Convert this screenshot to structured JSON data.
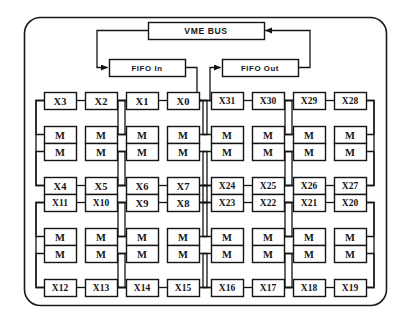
{
  "figure": {
    "frame": {
      "style": "rounded-rectangle",
      "stroke": "#1a1a1a"
    },
    "colors": {
      "background": "#ffffff",
      "box_fill": "#ffffff",
      "box_stroke": "#141414",
      "wire": "#141414",
      "text": "#141414"
    }
  },
  "bus": {
    "label": "VME BUS",
    "x": 148,
    "y": 22,
    "w": 116,
    "h": 17
  },
  "fifos": [
    {
      "name": "fifo-in",
      "label": "FIFO In",
      "x": 109,
      "y": 59,
      "w": 76,
      "h": 17
    },
    {
      "name": "fifo-out",
      "label": "FIFO Out",
      "x": 222,
      "y": 59,
      "w": 76,
      "h": 17
    }
  ],
  "arrows": [
    {
      "name": "bus-to-fifo-in",
      "from": "VME BUS",
      "to": "FIFO In",
      "direction": "left-down"
    },
    {
      "name": "fifo-out-to-bus",
      "from": "FIFO Out",
      "to": "VME BUS",
      "direction": "right-up"
    },
    {
      "name": "fifo-in-to-x0",
      "from": "FIFO In",
      "to": "X0",
      "direction": "down-left"
    },
    {
      "name": "x31-to-fifo-out",
      "from": "X31",
      "to": "FIFO Out",
      "direction": "up-right"
    }
  ],
  "grid": {
    "columns": 8,
    "rows": 4,
    "memory_label": "M",
    "col_x": [
      44,
      85,
      126,
      167,
      211,
      252,
      293,
      334
    ],
    "row_y": [
      92,
      143,
      194,
      245
    ],
    "box_w": 32,
    "box_h": 17,
    "row_gap": 17
  },
  "rows": [
    {
      "name": "row-1",
      "order": "x-top",
      "cells": [
        {
          "processor": "X3",
          "memory": "M"
        },
        {
          "processor": "X2",
          "memory": "M"
        },
        {
          "processor": "X1",
          "memory": "M"
        },
        {
          "processor": "X0",
          "memory": "M"
        },
        {
          "processor": "X31",
          "memory": "M"
        },
        {
          "processor": "X30",
          "memory": "M"
        },
        {
          "processor": "X29",
          "memory": "M"
        },
        {
          "processor": "X28",
          "memory": "M"
        }
      ]
    },
    {
      "name": "row-2",
      "order": "m-top",
      "cells": [
        {
          "memory": "M",
          "processor": "X4"
        },
        {
          "memory": "M",
          "processor": "X5"
        },
        {
          "memory": "M",
          "processor": "X6"
        },
        {
          "memory": "M",
          "processor": "X7"
        },
        {
          "memory": "M",
          "processor": "X24"
        },
        {
          "memory": "M",
          "processor": "X25"
        },
        {
          "memory": "M",
          "processor": "X26"
        },
        {
          "memory": "M",
          "processor": "X27"
        }
      ]
    },
    {
      "name": "row-3",
      "order": "x-top",
      "cells": [
        {
          "processor": "X11",
          "memory": "M"
        },
        {
          "processor": "X10",
          "memory": "M"
        },
        {
          "processor": "X9",
          "memory": "M"
        },
        {
          "processor": "X8",
          "memory": "M"
        },
        {
          "processor": "X23",
          "memory": "M"
        },
        {
          "processor": "X22",
          "memory": "M"
        },
        {
          "processor": "X21",
          "memory": "M"
        },
        {
          "processor": "X20",
          "memory": "M"
        }
      ]
    },
    {
      "name": "row-4",
      "order": "m-top",
      "cells": [
        {
          "memory": "M",
          "processor": "X12"
        },
        {
          "memory": "M",
          "processor": "X13"
        },
        {
          "memory": "M",
          "processor": "X14"
        },
        {
          "memory": "M",
          "processor": "X15"
        },
        {
          "memory": "M",
          "processor": "X16"
        },
        {
          "memory": "M",
          "processor": "X17"
        },
        {
          "memory": "M",
          "processor": "X18"
        },
        {
          "memory": "M",
          "processor": "X19"
        }
      ]
    }
  ]
}
